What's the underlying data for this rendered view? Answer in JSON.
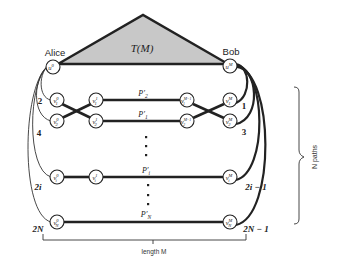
{
  "tree": {
    "label": "T(M)",
    "fill": "#c8c8c8"
  },
  "alice": {
    "label": "Alice",
    "node": {
      "base": "u",
      "sup": "0"
    }
  },
  "bob": {
    "label": "Bob",
    "node": {
      "base": "u",
      "sup": "M"
    }
  },
  "paths": [
    {
      "label_base": "P′",
      "label_sub": "2",
      "left_num": "2",
      "right_num": "1",
      "nodes": [
        {
          "base": "v",
          "sub": "1",
          "sup": "0"
        },
        {
          "base": "v",
          "sub": "1",
          "sup": "1"
        },
        {
          "base": "v",
          "sub": "1",
          "sup": "M−1"
        },
        {
          "base": "v",
          "sub": "1",
          "sup": "M"
        }
      ]
    },
    {
      "label_base": "P′",
      "label_sub": "1",
      "left_num": "4",
      "right_num": "3",
      "nodes": [
        {
          "base": "v",
          "sub": "2",
          "sup": "0"
        },
        {
          "base": "v",
          "sub": "2",
          "sup": "1"
        },
        {
          "base": "v",
          "sub": "2",
          "sup": "M−1"
        },
        {
          "base": "v",
          "sub": "2",
          "sup": "M"
        }
      ]
    },
    {
      "label_base": "P′",
      "label_sub": "i",
      "left_num": "2i",
      "right_num": "2i − 1",
      "nodes": [
        {
          "base": "v",
          "sub": "i",
          "sup": "0"
        },
        {
          "base": "v",
          "sub": "i",
          "sup": "1"
        },
        {
          "base": "v",
          "sub": "i",
          "sup": "M"
        }
      ]
    },
    {
      "label_base": "P′",
      "label_sub": "N",
      "left_num": "2N",
      "right_num": "2N − 1",
      "nodes": [
        {
          "base": "v",
          "sub": "N",
          "sup": "0"
        },
        {
          "base": "v",
          "sub": "N",
          "sup": "M"
        }
      ]
    }
  ],
  "length_label": "length M",
  "npaths_label": "N paths"
}
